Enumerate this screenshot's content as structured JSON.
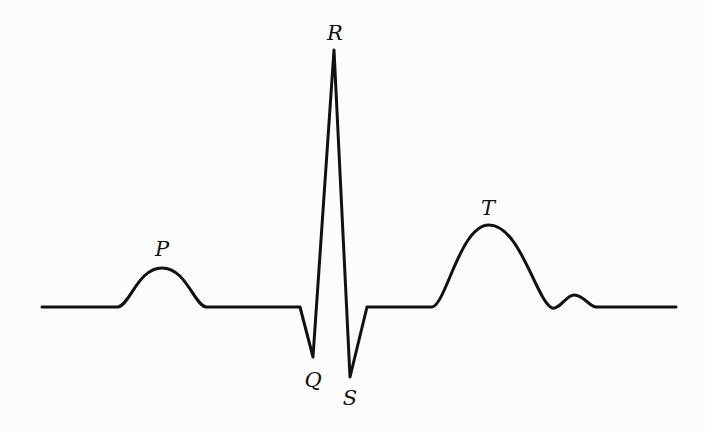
{
  "diagram": {
    "type": "ecg-waveform",
    "stroke_color": "#111111",
    "background": "#fcfcfc",
    "labels": {
      "p": "P",
      "q": "Q",
      "r": "R",
      "s": "S",
      "t": "T"
    },
    "points": {
      "baseline_y": 307,
      "start_x": 42,
      "end_x": 676,
      "p_wave": {
        "start_x": 118,
        "peak": [
          162,
          268
        ],
        "end_x": 206
      },
      "q": [
        313,
        357
      ],
      "r": [
        334,
        50
      ],
      "s": [
        350,
        377
      ],
      "t_wave": {
        "start_x": 432,
        "peak": [
          489,
          225
        ],
        "trough": [
          552,
          308
        ]
      },
      "u_wave": {
        "peak": [
          574,
          295
        ],
        "end_x": 596
      }
    }
  }
}
